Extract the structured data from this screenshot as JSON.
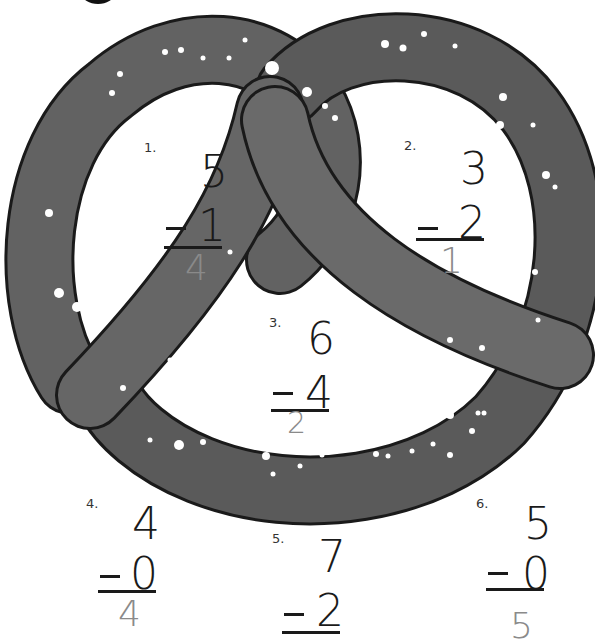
{
  "worksheet": {
    "illustration": "pretzel",
    "colors": {
      "pretzel_fill": "#5f5f5f",
      "pretzel_outline": "#1a1a1a",
      "salt": "#ffffff",
      "ink": "#1a1a1a",
      "answer_ink": "#8a8a8a"
    },
    "problems": [
      {
        "number": "1.",
        "top": "5",
        "operator": "−",
        "bottom": "1",
        "answer": "4"
      },
      {
        "number": "2.",
        "top": "3",
        "operator": "−",
        "bottom": "2",
        "answer": "1"
      },
      {
        "number": "3.",
        "top": "6",
        "operator": "−",
        "bottom": "4",
        "answer": "2"
      },
      {
        "number": "4.",
        "top": "4",
        "operator": "−",
        "bottom": "0",
        "answer": "4"
      },
      {
        "number": "5.",
        "top": "7",
        "operator": "−",
        "bottom": "2",
        "answer": ""
      },
      {
        "number": "6.",
        "top": "5",
        "operator": "−",
        "bottom": "0",
        "answer": "5"
      }
    ]
  }
}
